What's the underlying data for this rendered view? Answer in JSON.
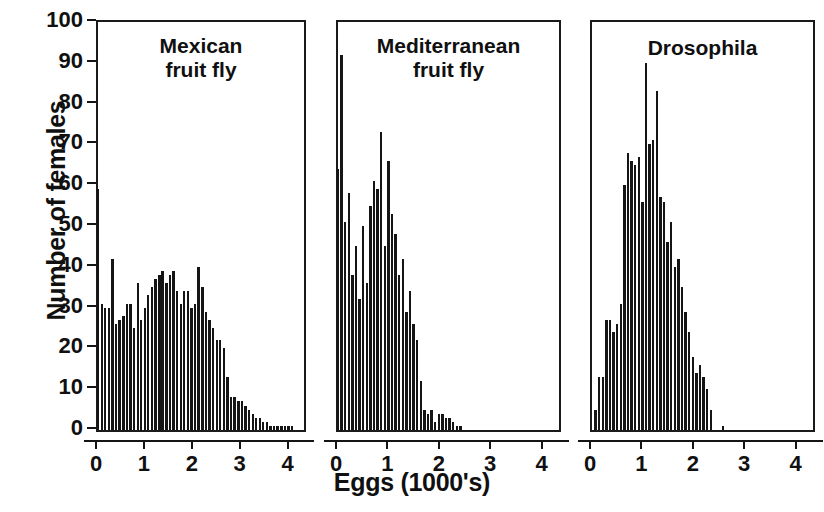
{
  "figure": {
    "ylabel": "Number of females",
    "xlabel": "Eggs (1000's)",
    "y_ticks": [
      0,
      10,
      20,
      30,
      40,
      50,
      60,
      70,
      80,
      90,
      100
    ],
    "x_ticks": [
      0,
      1,
      2,
      3,
      4
    ]
  },
  "panels": [
    {
      "title": "Mexican\nfruit fly"
    },
    {
      "title": "Mediterranean\nfruit fly"
    },
    {
      "title": "Drosophila"
    }
  ],
  "chart_data": [
    {
      "type": "bar",
      "title": "Mexican fruit fly",
      "xlabel": "Eggs (1000's)",
      "ylabel": "Number of females",
      "xlim": [
        0,
        4.3
      ],
      "ylim": [
        0,
        100
      ],
      "grid": false,
      "legend": "none",
      "bin_width": 0.075,
      "x": [
        0.0,
        0.08,
        0.15,
        0.23,
        0.3,
        0.38,
        0.45,
        0.53,
        0.6,
        0.68,
        0.75,
        0.83,
        0.9,
        0.98,
        1.05,
        1.13,
        1.2,
        1.28,
        1.35,
        1.43,
        1.5,
        1.58,
        1.65,
        1.73,
        1.8,
        1.88,
        1.95,
        2.03,
        2.1,
        2.18,
        2.25,
        2.33,
        2.4,
        2.48,
        2.55,
        2.63,
        2.7,
        2.78,
        2.85,
        2.93,
        3.0,
        3.08,
        3.15,
        3.23,
        3.3,
        3.38,
        3.45,
        3.53,
        3.6,
        3.68,
        3.75,
        3.83,
        3.9,
        3.98,
        4.05
      ],
      "values": [
        59,
        31,
        30,
        30,
        42,
        26,
        27,
        28,
        31,
        31,
        25,
        36,
        27,
        30,
        33,
        35,
        37,
        38,
        39,
        36,
        38,
        39,
        34,
        31,
        34,
        34,
        30,
        31,
        40,
        35,
        29,
        27,
        25,
        22,
        22,
        20,
        13,
        8,
        8,
        7,
        7,
        6,
        5,
        4,
        3,
        3,
        2,
        2,
        1,
        1,
        1,
        1,
        1,
        1,
        1
      ]
    },
    {
      "type": "bar",
      "title": "Mediterranean fruit fly",
      "xlabel": "Eggs (1000's)",
      "ylabel": "Number of females",
      "xlim": [
        0,
        4.3
      ],
      "ylim": [
        0,
        100
      ],
      "grid": false,
      "legend": "none",
      "bin_width": 0.065,
      "x": [
        0.0,
        0.07,
        0.14,
        0.21,
        0.28,
        0.35,
        0.42,
        0.49,
        0.56,
        0.63,
        0.7,
        0.77,
        0.84,
        0.91,
        0.98,
        1.05,
        1.12,
        1.19,
        1.26,
        1.33,
        1.4,
        1.47,
        1.54,
        1.61,
        1.68,
        1.75,
        1.82,
        1.89,
        1.96,
        2.03,
        2.1,
        2.17,
        2.24,
        2.31,
        2.38
      ],
      "values": [
        64,
        92,
        51,
        58,
        38,
        45,
        32,
        50,
        36,
        55,
        61,
        59,
        73,
        45,
        66,
        53,
        48,
        38,
        42,
        29,
        34,
        26,
        22,
        12,
        5,
        4,
        5,
        2,
        4,
        4,
        3,
        3,
        2,
        1,
        1
      ]
    },
    {
      "type": "bar",
      "title": "Drosophila",
      "xlabel": "Eggs (1000's)",
      "ylabel": "Number of females",
      "xlim": [
        0,
        4.3
      ],
      "ylim": [
        0,
        100
      ],
      "grid": false,
      "legend": "none",
      "bin_width": 0.06,
      "x": [
        0.07,
        0.14,
        0.21,
        0.28,
        0.35,
        0.42,
        0.49,
        0.56,
        0.63,
        0.7,
        0.77,
        0.84,
        0.91,
        0.98,
        1.05,
        1.12,
        1.19,
        1.26,
        1.33,
        1.4,
        1.47,
        1.54,
        1.61,
        1.68,
        1.75,
        1.82,
        1.89,
        1.96,
        2.03,
        2.1,
        2.17,
        2.24,
        2.31,
        2.55
      ],
      "values": [
        5,
        13,
        13,
        27,
        27,
        24,
        26,
        31,
        60,
        68,
        66,
        65,
        67,
        56,
        90,
        70,
        71,
        83,
        57,
        56,
        46,
        51,
        40,
        42,
        35,
        29,
        24,
        18,
        14,
        16,
        13,
        10,
        5,
        1
      ]
    }
  ]
}
